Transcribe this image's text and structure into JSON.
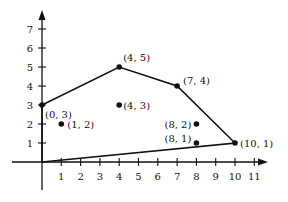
{
  "chart_data": {
    "type": "scatter",
    "title": "",
    "xlabel": "",
    "ylabel": "",
    "xlim": [
      0,
      11
    ],
    "ylim": [
      0,
      7
    ],
    "grid": false,
    "x_ticks": [
      "1",
      "2",
      "3",
      "4",
      "5",
      "6",
      "7",
      "8",
      "9",
      "10",
      "11"
    ],
    "y_ticks": [
      "1",
      "2",
      "3",
      "4",
      "5",
      "6",
      "7"
    ],
    "points": [
      {
        "x": 0,
        "y": 3,
        "label": "(0, 3)"
      },
      {
        "x": 1,
        "y": 2,
        "label": "(1, 2)"
      },
      {
        "x": 4,
        "y": 5,
        "label": "(4, 5)"
      },
      {
        "x": 4,
        "y": 3,
        "label": "(4, 3)"
      },
      {
        "x": 7,
        "y": 4,
        "label": "(7, 4)"
      },
      {
        "x": 8,
        "y": 2,
        "label": "(8, 2)"
      },
      {
        "x": 8,
        "y": 1,
        "label": "(8, 1)"
      },
      {
        "x": 10,
        "y": 1,
        "label": "(10, 1)"
      }
    ],
    "hull_polygon": [
      [
        0,
        0
      ],
      [
        0,
        3
      ],
      [
        4,
        5
      ],
      [
        7,
        4
      ],
      [
        10,
        1
      ],
      [
        0,
        0
      ]
    ]
  }
}
